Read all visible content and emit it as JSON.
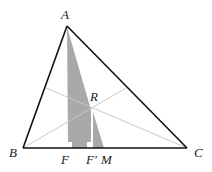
{
  "diagram": {
    "type": "triangle-geometry",
    "points": {
      "A": {
        "label": "A",
        "x": 67,
        "y": 26
      },
      "B": {
        "label": "B",
        "x": 23,
        "y": 148
      },
      "C": {
        "label": "C",
        "x": 187,
        "y": 148
      },
      "R": {
        "label": "R",
        "x": 91,
        "y": 107
      },
      "F": {
        "label": "F",
        "x": 68,
        "y": 148
      },
      "F_prime": {
        "label": "F′",
        "x": 93,
        "y": 148
      },
      "M": {
        "label": "M",
        "x": 104,
        "y": 148
      }
    },
    "labels": {
      "A": "A",
      "B": "B",
      "C": "C",
      "R": "R",
      "F": "F",
      "F_prime": "F′",
      "M": "M"
    },
    "colors": {
      "edge": "#111111",
      "cevian": "#c8c8c8",
      "shade": "#a9a9a9",
      "background": "#ffffff"
    }
  }
}
